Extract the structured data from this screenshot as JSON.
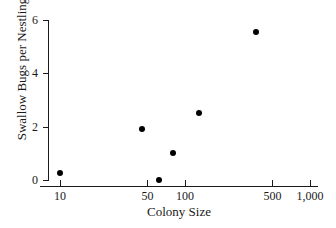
{
  "chart_data": {
    "type": "scatter",
    "title": "",
    "xlabel": "Colony Size",
    "ylabel": "Swallow Bugs per Nestling",
    "xscale": "log",
    "yscale": "linear",
    "xlim": [
      8,
      1000
    ],
    "ylim": [
      0,
      6
    ],
    "grid": false,
    "legend": null,
    "x_ticks": [
      {
        "value": 10,
        "label": "10"
      },
      {
        "value": 50,
        "label": "50"
      },
      {
        "value": 100,
        "label": "100"
      },
      {
        "value": 500,
        "label": "500"
      },
      {
        "value": 1000,
        "label": "1,000"
      }
    ],
    "y_ticks": [
      {
        "value": 0,
        "label": "0"
      },
      {
        "value": 2,
        "label": "2"
      },
      {
        "value": 4,
        "label": "4"
      },
      {
        "value": 6,
        "label": "6"
      }
    ],
    "points": [
      {
        "x": 10,
        "y": 0.25
      },
      {
        "x": 45,
        "y": 1.9
      },
      {
        "x": 62,
        "y": 0.0
      },
      {
        "x": 80,
        "y": 1.0
      },
      {
        "x": 130,
        "y": 2.5
      },
      {
        "x": 370,
        "y": 5.55
      }
    ],
    "marker": {
      "shape": "circle",
      "color": "#000000",
      "size": 6
    },
    "axis_color": "#1a1a1a",
    "background": "#ffffff"
  }
}
